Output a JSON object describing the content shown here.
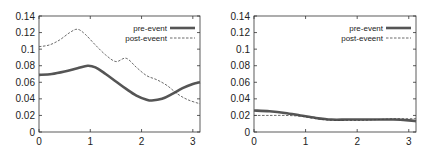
{
  "chart_data": [
    {
      "type": "line",
      "title": "",
      "xlabel": "",
      "ylabel": "",
      "xlim": [
        0,
        3.14
      ],
      "ylim": [
        0,
        0.14
      ],
      "xticks": [
        "0",
        "1",
        "2",
        "3"
      ],
      "yticks": [
        "0",
        "0.02",
        "0.04",
        "0.06",
        "0.08",
        "0.1",
        "0.12",
        "0.14"
      ],
      "grid": false,
      "legend_position": "top-right",
      "series": [
        {
          "name": "pre-event",
          "style": "solid-thick",
          "x": [
            0,
            0.25,
            0.5,
            0.75,
            0.95,
            1.1,
            1.3,
            1.5,
            1.7,
            1.9,
            2.1,
            2.2,
            2.4,
            2.6,
            2.8,
            3.0,
            3.14
          ],
          "values": [
            0.069,
            0.07,
            0.073,
            0.077,
            0.08,
            0.078,
            0.07,
            0.061,
            0.052,
            0.044,
            0.039,
            0.038,
            0.04,
            0.046,
            0.053,
            0.058,
            0.06
          ]
        },
        {
          "name": "post-eveent",
          "style": "dashed-thin",
          "x": [
            0,
            0.2,
            0.4,
            0.6,
            0.75,
            0.9,
            1.1,
            1.3,
            1.5,
            1.7,
            1.9,
            2.1,
            2.3,
            2.5,
            2.7,
            2.9,
            3.14
          ],
          "values": [
            0.103,
            0.105,
            0.111,
            0.12,
            0.124,
            0.118,
            0.105,
            0.093,
            0.085,
            0.089,
            0.078,
            0.068,
            0.063,
            0.056,
            0.046,
            0.039,
            0.034
          ]
        }
      ]
    },
    {
      "type": "line",
      "title": "",
      "xlabel": "",
      "ylabel": "",
      "xlim": [
        0,
        3.14
      ],
      "ylim": [
        0,
        0.14
      ],
      "xticks": [
        "0",
        "1",
        "2",
        "3"
      ],
      "yticks": [
        "0",
        "0.02",
        "0.04",
        "0.06",
        "0.08",
        "0.1",
        "0.12",
        "0.14"
      ],
      "grid": false,
      "legend_position": "top-right",
      "series": [
        {
          "name": "pre-event",
          "style": "solid-thick",
          "x": [
            0,
            0.3,
            0.6,
            0.9,
            1.2,
            1.5,
            1.8,
            2.1,
            2.4,
            2.7,
            3.0,
            3.14
          ],
          "values": [
            0.026,
            0.025,
            0.023,
            0.02,
            0.017,
            0.015,
            0.015,
            0.015,
            0.015,
            0.015,
            0.014,
            0.013
          ]
        },
        {
          "name": "post-eveent",
          "style": "dashed-thin",
          "x": [
            0,
            0.3,
            0.6,
            0.9,
            1.2,
            1.5,
            1.8,
            2.1,
            2.4,
            2.7,
            3.0,
            3.14
          ],
          "values": [
            0.02,
            0.02,
            0.02,
            0.019,
            0.016,
            0.014,
            0.014,
            0.014,
            0.015,
            0.016,
            0.016,
            0.016
          ]
        }
      ]
    }
  ]
}
